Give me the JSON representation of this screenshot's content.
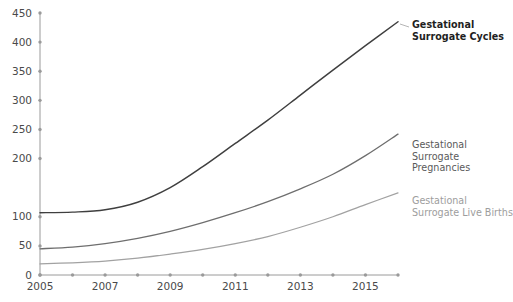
{
  "chart_data": {
    "type": "line",
    "title": "",
    "subtitle": "",
    "xlabel": "",
    "ylabel": "",
    "x": [
      2005,
      2006,
      2007,
      2008,
      2009,
      2010,
      2011,
      2012,
      2013,
      2014,
      2015,
      2016
    ],
    "xlim": [
      2005,
      2016
    ],
    "ylim": [
      0,
      450
    ],
    "grid": false,
    "legend_position": "right-inline-annotations",
    "x_tick_labels": [
      "2005",
      "",
      "2007",
      "",
      "2009",
      "",
      "2011",
      "",
      "2013",
      "",
      "2015",
      ""
    ],
    "x_labeled_years": [
      "2005",
      "2007",
      "2009",
      "2011",
      "2013",
      "2015"
    ],
    "y_tick_labels": [
      "0",
      "50",
      "100",
      "200",
      "250",
      "300",
      "350",
      "400",
      "450"
    ],
    "y_tick_values": [
      0,
      50,
      100,
      200,
      250,
      300,
      350,
      400,
      450
    ],
    "series": [
      {
        "name": "Gestational Surrogate Cycles",
        "label_line1": "Gestational",
        "label_line2": "Surrogate Cycles",
        "color": "#3f3f3f",
        "values": [
          107,
          108,
          112,
          125,
          150,
          186,
          226,
          266,
          309,
          352,
          394,
          435
        ]
      },
      {
        "name": "Gestational Surrogate Pregnancies",
        "label_line1": "Gestational",
        "label_line2": "Surrogate Pregnancies",
        "color": "#6e6e6e",
        "values": [
          45,
          48,
          54,
          63,
          75,
          90,
          107,
          126,
          148,
          173,
          205,
          242
        ]
      },
      {
        "name": "Gestational Surrogate Live Births",
        "label_line1": "Gestational",
        "label_line2": "Surrogate Live Births",
        "color": "#a2a2a2",
        "values": [
          19,
          21,
          24,
          29,
          36,
          44,
          54,
          66,
          82,
          100,
          121,
          141
        ]
      }
    ]
  },
  "annotations": {
    "cycles": "Gestational\nSurrogate Cycles",
    "pregnancies": "Gestational\nSurrogate Pregnancies",
    "births": "Gestational\nSurrogate Live Births"
  },
  "colors": {
    "axis": "#9a9a9a",
    "tick_label": "#4a4a4a",
    "background": "#ffffff",
    "cycles": "#3f3f3f",
    "pregnancies": "#6e6e6e",
    "births": "#a2a2a2"
  }
}
